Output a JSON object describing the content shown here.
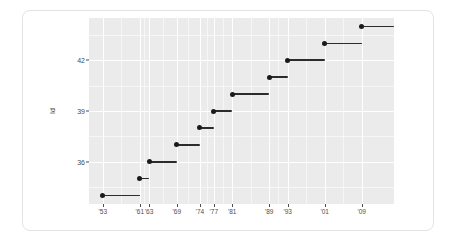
{
  "chart": {
    "title": "",
    "subtitle": ""
  },
  "chart_data": {
    "type": "scatter",
    "title": "",
    "xlabel": "",
    "ylabel": "Id",
    "xlim": [
      1950,
      2016
    ],
    "ylim": [
      33.5,
      44.5
    ],
    "grid": true,
    "legend": false,
    "x_tick_labels": [
      "'53",
      "'61",
      "'63",
      "'69",
      "'74",
      "'77",
      "'81",
      "'89",
      "'93",
      "'01",
      "'09"
    ],
    "x_tick_values": [
      1953,
      1961,
      1963,
      1969,
      1974,
      1977,
      1981,
      1989,
      1993,
      2001,
      2009
    ],
    "y_tick_labels": [
      "36",
      "39",
      "42"
    ],
    "y_tick_values": [
      36,
      39,
      42
    ],
    "series": [
      {
        "name": "Id",
        "points": [
          {
            "label": "34",
            "y": 34.0,
            "x_start": 1953,
            "x_end": 1961
          },
          {
            "label": "35",
            "y": 35.0,
            "x_start": 1961,
            "x_end": 1963
          },
          {
            "label": "36",
            "y": 36.0,
            "x_start": 1963,
            "x_end": 1969
          },
          {
            "label": "37",
            "y": 37.0,
            "x_start": 1969,
            "x_end": 1974
          },
          {
            "label": "38",
            "y": 38.0,
            "x_start": 1974,
            "x_end": 1977
          },
          {
            "label": "39",
            "y": 39.0,
            "x_start": 1977,
            "x_end": 1981
          },
          {
            "label": "40",
            "y": 40.0,
            "x_start": 1981,
            "x_end": 1989
          },
          {
            "label": "41",
            "y": 41.0,
            "x_start": 1989,
            "x_end": 1993
          },
          {
            "label": "42",
            "y": 42.0,
            "x_start": 1993,
            "x_end": 2001
          },
          {
            "label": "43",
            "y": 43.0,
            "x_start": 2001,
            "x_end": 2009
          },
          {
            "label": "44",
            "y": 44.0,
            "x_start": 2009,
            "x_end": 2016
          }
        ]
      }
    ]
  },
  "style": {
    "panel_bg": "#ebebeb",
    "grid_color": "#ffffff",
    "point_color": "#1a1a1a",
    "segment_color": "#2b2b2b",
    "axis_text_color": "#4d4d4d",
    "card_border": "#e3e3e3",
    "page_bg": "#ffffff"
  }
}
